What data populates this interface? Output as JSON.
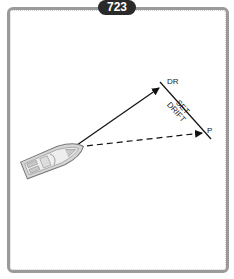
{
  "figure": {
    "number": "723"
  },
  "labels": {
    "dr": "DR",
    "set": "SET",
    "drift": "DRIFT",
    "p": "P"
  },
  "colors": {
    "frame": "#9a9a9a",
    "badge_bg": "#2a2a2a",
    "lines": "#111111",
    "boat_fill": "#d6d6d6"
  }
}
